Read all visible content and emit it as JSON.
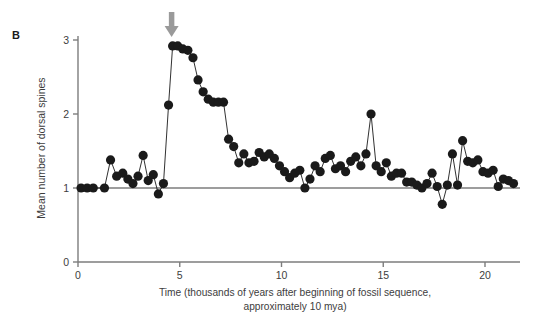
{
  "figure": {
    "panel_label": "B",
    "arrow": {
      "icon": "down-arrow-icon",
      "x_value": 4.6,
      "color": "#9a9a9a"
    },
    "background_color": "#ffffff",
    "axis_color": "#7d7d7d",
    "series_color": "#1a1a1a"
  },
  "chart_data": {
    "type": "line",
    "title": "",
    "subtitle": "",
    "xlabel": "Time (thousands of years after beginning of fossil sequence, approximately 10 mya)",
    "ylabel": "Mean number of dorsal spines",
    "xlim": [
      0,
      21.8
    ],
    "ylim": [
      0,
      3.15
    ],
    "xticks": [
      0,
      5,
      10,
      15,
      20
    ],
    "xtick_labels": [
      "0",
      "5",
      "10",
      "15",
      "20"
    ],
    "yticks": [
      0,
      1,
      2,
      3
    ],
    "ytick_labels": [
      "0",
      "1",
      "2",
      "3"
    ],
    "grid": false,
    "reference_line_y": 1,
    "legend": [],
    "annotations": [
      {
        "text": "B",
        "type": "panel-label"
      },
      {
        "text": "down-arrow",
        "type": "arrow",
        "x": 4.6,
        "y": 3.12
      }
    ],
    "markers": {
      "shape": "circle",
      "size": 4.6,
      "filled": true
    },
    "series": [
      {
        "name": "Mean number of dorsal spines",
        "x": [
          0.15,
          0.45,
          0.75,
          1.3,
          1.6,
          1.9,
          2.2,
          2.45,
          2.7,
          2.95,
          3.2,
          3.45,
          3.7,
          3.95,
          4.2,
          4.45,
          4.65,
          4.9,
          5.15,
          5.4,
          5.65,
          5.9,
          6.15,
          6.4,
          6.65,
          6.9,
          7.15,
          7.4,
          7.65,
          7.9,
          8.15,
          8.4,
          8.65,
          8.9,
          9.15,
          9.4,
          9.65,
          9.9,
          10.15,
          10.4,
          10.65,
          10.9,
          11.15,
          11.4,
          11.65,
          11.9,
          12.15,
          12.4,
          12.65,
          12.9,
          13.15,
          13.4,
          13.65,
          13.9,
          14.15,
          14.4,
          14.65,
          14.9,
          15.15,
          15.4,
          15.65,
          15.9,
          16.15,
          16.4,
          16.65,
          16.9,
          17.15,
          17.4,
          17.65,
          17.9,
          18.15,
          18.4,
          18.65,
          18.9,
          19.15,
          19.4,
          19.65,
          19.9,
          20.15,
          20.4,
          20.65,
          20.9,
          21.15,
          21.4
        ],
        "y": [
          1.0,
          1.0,
          1.0,
          1.0,
          1.38,
          1.16,
          1.2,
          1.12,
          1.06,
          1.16,
          1.44,
          1.1,
          1.18,
          0.92,
          1.06,
          2.12,
          2.92,
          2.92,
          2.88,
          2.86,
          2.76,
          2.46,
          2.3,
          2.2,
          2.16,
          2.16,
          2.16,
          1.66,
          1.56,
          1.34,
          1.46,
          1.34,
          1.36,
          1.48,
          1.42,
          1.46,
          1.4,
          1.3,
          1.22,
          1.14,
          1.2,
          1.24,
          1.0,
          1.12,
          1.3,
          1.22,
          1.4,
          1.44,
          1.26,
          1.3,
          1.22,
          1.36,
          1.42,
          1.3,
          1.46,
          2.0,
          1.3,
          1.22,
          1.34,
          1.16,
          1.2,
          1.2,
          1.08,
          1.08,
          1.04,
          1.0,
          1.06,
          1.2,
          1.02,
          0.78,
          1.04,
          1.46,
          1.04,
          1.64,
          1.36,
          1.34,
          1.38,
          1.22,
          1.2,
          1.24,
          1.02,
          1.12,
          1.1,
          1.06
        ]
      }
    ]
  }
}
